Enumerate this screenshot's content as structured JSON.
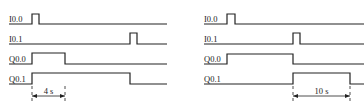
{
  "diagrams": [
    {
      "name": "left-timing-diagram",
      "signals": [
        {
          "label": "I0.0",
          "baseline_y": 24,
          "high_y": 14,
          "x_start": 9,
          "x_end": 167,
          "pulses": [
            [
              32,
              39
            ]
          ]
        },
        {
          "label": "I0.1",
          "baseline_y": 44,
          "high_y": 33,
          "x_start": 9,
          "x_end": 167,
          "pulses": [
            [
              130,
              137
            ]
          ]
        },
        {
          "label": "Q0.0",
          "baseline_y": 64,
          "high_y": 53,
          "x_start": 9,
          "x_end": 167,
          "pulses": [
            [
              32,
              65
            ]
          ]
        },
        {
          "label": "Q0.1",
          "baseline_y": 84,
          "high_y": 73,
          "x_start": 9,
          "x_end": 167,
          "pulses": [
            [
              32,
              130
            ]
          ]
        }
      ],
      "dimension": {
        "label": "4 s",
        "x1": 32,
        "x2": 65,
        "y": 96
      }
    },
    {
      "name": "right-timing-diagram",
      "signals": [
        {
          "label": "I0.0",
          "baseline_y": 24,
          "high_y": 14,
          "x_start": 204,
          "x_end": 364,
          "pulses": [
            [
              227,
              235
            ]
          ]
        },
        {
          "label": "I0.1",
          "baseline_y": 44,
          "high_y": 33,
          "x_start": 204,
          "x_end": 364,
          "pulses": [
            [
              293,
              300
            ]
          ]
        },
        {
          "label": "Q0.0",
          "baseline_y": 64,
          "high_y": 54,
          "x_start": 204,
          "x_end": 364,
          "pulses": [
            [
              227,
              293
            ]
          ]
        },
        {
          "label": "Q0.1",
          "baseline_y": 84,
          "high_y": 73,
          "x_start": 204,
          "x_end": 364,
          "pulses": [
            [
              293,
              350
            ]
          ]
        }
      ],
      "dimension": {
        "label": "10 s",
        "x1": 293,
        "x2": 350,
        "y": 96
      }
    }
  ],
  "colors": {
    "stroke": "#222222",
    "background": "#ffffff"
  }
}
